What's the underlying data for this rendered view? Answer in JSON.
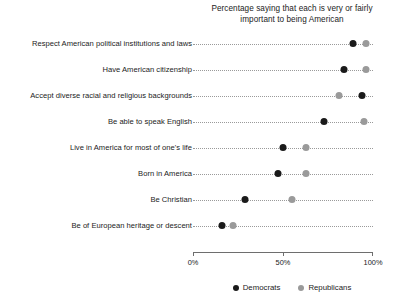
{
  "chart_data": {
    "type": "scatter",
    "title": "Percentage saying that each is very or fairly important to being American",
    "title_line1": "Percentage saying that each is very or fairly",
    "title_line2": "important to being American",
    "xlabel": "",
    "ylabel": "",
    "xlim": [
      0,
      100
    ],
    "grid": false,
    "legend_position": "bottom",
    "xticks": [
      0,
      50,
      100
    ],
    "xtick_labels": [
      "0%",
      "50%",
      "100%"
    ],
    "categories": [
      "Respect American political institutions and laws",
      "Have American citizenship",
      "Accept diverse racial and religious backgrounds",
      "Be able to speak English",
      "Live in America for most of one's life",
      "Born in America",
      "Be Christian",
      "Be of European heritage or descent"
    ],
    "series": [
      {
        "name": "Democrats",
        "color": "#1a1a1a",
        "values": [
          89,
          84,
          94,
          73,
          50,
          47,
          29,
          16
        ]
      },
      {
        "name": "Republicans",
        "color": "#9a9a9a",
        "values": [
          96,
          96,
          81,
          95,
          63,
          63,
          55,
          22
        ]
      }
    ]
  }
}
